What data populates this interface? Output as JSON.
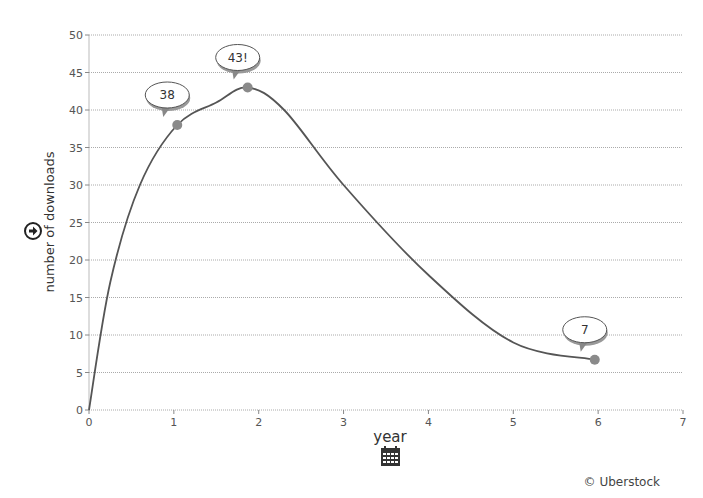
{
  "chart_data": {
    "type": "line",
    "title": "",
    "xlabel": "year",
    "ylabel": "number of downloads",
    "xlim": [
      0,
      7
    ],
    "ylim": [
      0,
      50
    ],
    "x_ticks": [
      "0",
      "1",
      "2",
      "3",
      "4",
      "5",
      "6",
      "7"
    ],
    "y_ticks": [
      "0",
      "5",
      "10",
      "15",
      "20",
      "25",
      "30",
      "35",
      "40",
      "45",
      "50"
    ],
    "grid": true,
    "grid_style": "dotted horizontal",
    "smooth": true,
    "series": [
      {
        "name": "downloads",
        "x": [
          0,
          0.25,
          0.6,
          1.04,
          1.5,
          1.87,
          2.3,
          3.0,
          4.0,
          5.0,
          5.96
        ],
        "values": [
          0,
          17,
          30,
          38,
          41,
          43,
          40,
          30,
          18,
          9,
          6.7
        ],
        "color": "#555555"
      }
    ],
    "markers": [
      {
        "x": 1.04,
        "y": 38,
        "label": "38"
      },
      {
        "x": 1.87,
        "y": 43,
        "label": "43!"
      },
      {
        "x": 5.96,
        "y": 6.7,
        "label": "7"
      }
    ],
    "annotations": [
      "38",
      "43!",
      "7"
    ]
  },
  "icons": {
    "y_axis_icon": "arrow-circle-right-icon",
    "x_axis_icon": "calendar-icon"
  },
  "credit": "© Uberstock",
  "colors": {
    "line": "#555555",
    "marker": "#8a8a8a",
    "grid": "#aaaaaa",
    "text": "#444444"
  }
}
